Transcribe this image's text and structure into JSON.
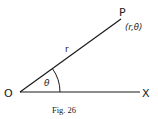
{
  "figure": {
    "caption": "Fig. 26",
    "labels": {
      "origin": "O",
      "axis_end": "X",
      "point": "P",
      "point_coords": "(r,θ)",
      "radius": "r",
      "angle": "θ"
    },
    "colors": {
      "ink": "#1a1a1a",
      "background": "#ffffff"
    }
  }
}
